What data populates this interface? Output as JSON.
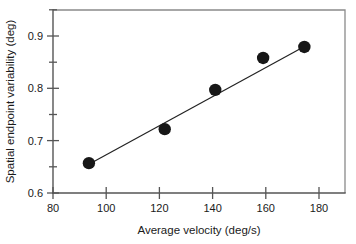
{
  "chart_data": {
    "type": "scatter",
    "title": "",
    "xlabel": "Average velocity (deg/s)",
    "ylabel": "Spatial endpoint variability (deg)",
    "xlim": [
      80,
      184
    ],
    "ylim": [
      0.6,
      0.95
    ],
    "xticks": [
      80,
      100,
      120,
      140,
      160,
      180
    ],
    "xtick_labels": [
      "80",
      "100",
      "120",
      "140",
      "160",
      "180"
    ],
    "yticks": [
      0.6,
      0.7,
      0.8,
      0.9
    ],
    "ytick_labels": [
      "0.6",
      "0.7",
      "0.8",
      "0.9"
    ],
    "yminor_ticks": [
      0.65,
      0.75,
      0.85,
      0.95
    ],
    "grid": false,
    "legend": false,
    "marker": "filled-circle",
    "marker_color": "#171717",
    "line_color": "#222222",
    "axis_color": "#555555",
    "frame_color": "#8a8a8a",
    "background": "#ffffff",
    "x": [
      93.5,
      122.0,
      141.0,
      159.0,
      174.5
    ],
    "y": [
      0.657,
      0.722,
      0.797,
      0.858,
      0.879
    ],
    "points": [
      {
        "x": 93.5,
        "y": 0.657
      },
      {
        "x": 122.0,
        "y": 0.722
      },
      {
        "x": 141.0,
        "y": 0.797
      },
      {
        "x": 159.0,
        "y": 0.858
      },
      {
        "x": 174.5,
        "y": 0.879
      }
    ],
    "fit_line": {
      "type": "linear",
      "x_start": 93.5,
      "y_start": 0.655,
      "x_end": 174.5,
      "y_end": 0.88
    }
  },
  "axes": {
    "x_title": "Average velocity (deg/s)",
    "y_title": "Spatial endpoint variability (deg)",
    "x_tick_labels": [
      "80",
      "100",
      "120",
      "140",
      "160",
      "180"
    ],
    "y_tick_labels": [
      "0.9",
      "0.8",
      "0.7",
      "0.6"
    ]
  }
}
